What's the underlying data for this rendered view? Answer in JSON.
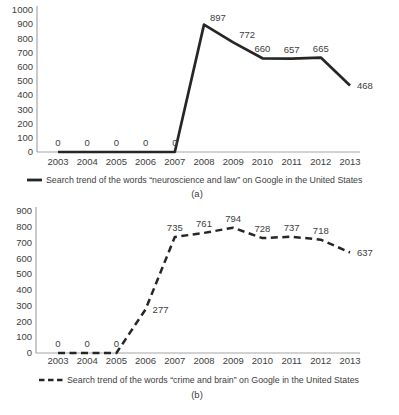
{
  "figure": {
    "background": "#ffffff"
  },
  "colors": {
    "series_line": "#262626",
    "axis_line": "#a6a6a6",
    "text": "#404040"
  },
  "chart_data": [
    {
      "type": "line",
      "title": "",
      "xlabel": "",
      "ylabel": "",
      "caption": "(a)",
      "x": [
        "2003",
        "2004",
        "2005",
        "2006",
        "2007",
        "2008",
        "2009",
        "2010",
        "2011",
        "2012",
        "2013"
      ],
      "series": [
        {
          "name": "Search trend of the words “neuroscience and law” on Google in the United States",
          "values": [
            0,
            0,
            0,
            0,
            0,
            897,
            772,
            660,
            657,
            665,
            468
          ],
          "line_style": "solid"
        }
      ],
      "ylim": [
        0,
        1000
      ],
      "ytick_step": 100,
      "yticks": [
        0,
        100,
        200,
        300,
        400,
        500,
        600,
        700,
        800,
        900,
        1000
      ],
      "grid": false,
      "legend_position": "bottom",
      "data_labels": true,
      "label_placement": [
        "above",
        "above",
        "above",
        "above",
        "above",
        "above-right",
        "above-right",
        "above",
        "above",
        "above",
        "right"
      ]
    },
    {
      "type": "line",
      "title": "",
      "xlabel": "",
      "ylabel": "",
      "caption": "(b)",
      "x": [
        "2003",
        "2004",
        "2005",
        "2006",
        "2007",
        "2008",
        "2009",
        "2010",
        "2011",
        "2012",
        "2013"
      ],
      "series": [
        {
          "name": "Search trend of the words “crime and brain” on Google in the United States",
          "values": [
            0,
            0,
            0,
            277,
            735,
            761,
            794,
            728,
            737,
            718,
            637
          ],
          "line_style": "dashed"
        }
      ],
      "ylim": [
        0,
        900
      ],
      "ytick_step": 100,
      "yticks": [
        0,
        100,
        200,
        300,
        400,
        500,
        600,
        700,
        800,
        900
      ],
      "grid": false,
      "legend_position": "bottom",
      "data_labels": true,
      "label_placement": [
        "above",
        "above",
        "above",
        "right",
        "above",
        "above",
        "above",
        "above",
        "above",
        "above",
        "right"
      ]
    }
  ]
}
